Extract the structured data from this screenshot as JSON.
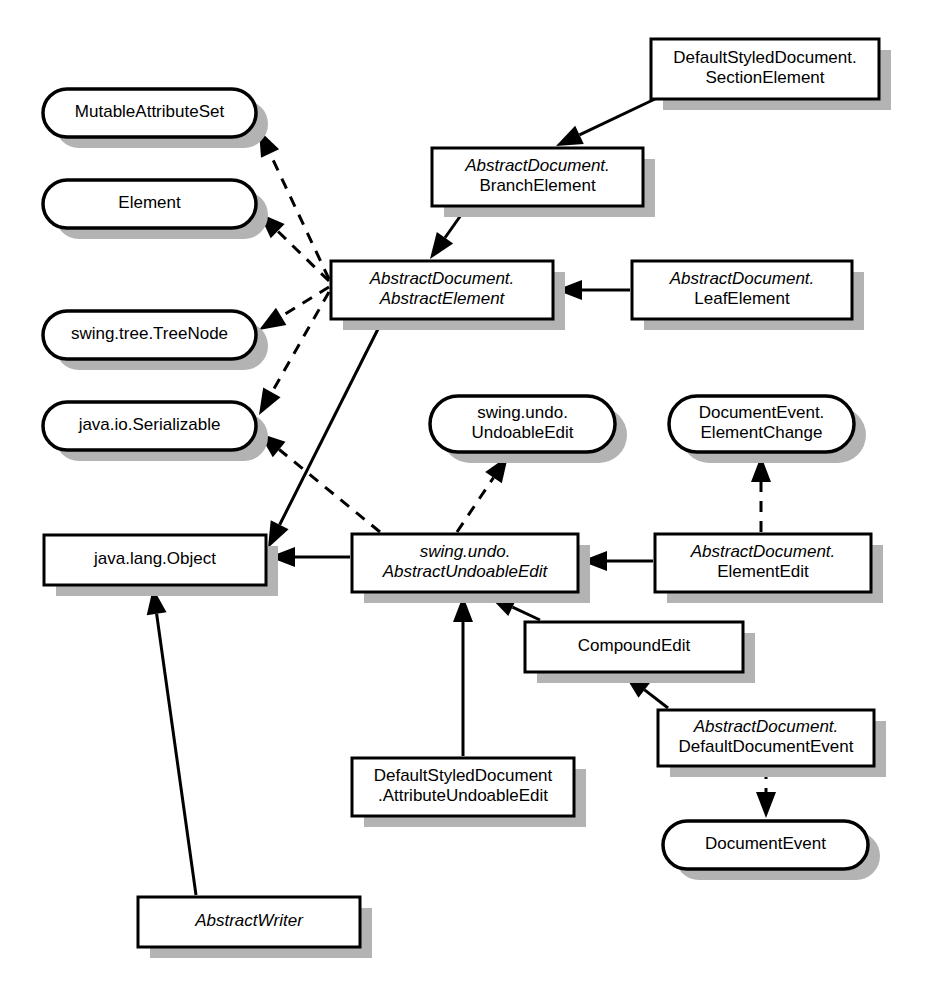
{
  "diagram": {
    "kind": "uml-class-diagram",
    "canvas": {
      "width": 928,
      "height": 1006,
      "background": "#ffffff"
    },
    "style": {
      "box_fill": "#ffffff",
      "box_stroke": "#000000",
      "shadow_color": "#b3b3b3",
      "text_color": "#000000"
    },
    "nodes": [
      {
        "id": "section-element",
        "shape": "class",
        "lines": [
          {
            "text": "DefaultStyledDocument.",
            "italic": false
          },
          {
            "text": "SectionElement",
            "italic": false
          }
        ],
        "x": 651,
        "y": 39,
        "w": 228,
        "h": 60
      },
      {
        "id": "mutable-attribute-set",
        "shape": "interface",
        "lines": [
          {
            "text": "MutableAttributeSet",
            "italic": false
          }
        ],
        "x": 43,
        "y": 89,
        "w": 213,
        "h": 48
      },
      {
        "id": "branch-element",
        "shape": "class",
        "lines": [
          {
            "text": "AbstractDocument.",
            "italic": true
          },
          {
            "text": "BranchElement",
            "italic": false
          }
        ],
        "x": 432,
        "y": 148,
        "w": 211,
        "h": 58
      },
      {
        "id": "element",
        "shape": "interface",
        "lines": [
          {
            "text": "Element",
            "italic": false
          }
        ],
        "x": 43,
        "y": 180,
        "w": 213,
        "h": 48
      },
      {
        "id": "abstract-element",
        "shape": "class",
        "lines": [
          {
            "text": "AbstractDocument.",
            "italic": true
          },
          {
            "text": "AbstractElement",
            "italic": true
          }
        ],
        "x": 331,
        "y": 261,
        "w": 222,
        "h": 58
      },
      {
        "id": "leaf-element",
        "shape": "class",
        "lines": [
          {
            "text": "AbstractDocument.",
            "italic": true
          },
          {
            "text": "LeafElement",
            "italic": false
          }
        ],
        "x": 632,
        "y": 261,
        "w": 220,
        "h": 58
      },
      {
        "id": "tree-node",
        "shape": "interface",
        "lines": [
          {
            "text": "swing.tree.TreeNode",
            "italic": false
          }
        ],
        "x": 43,
        "y": 311,
        "w": 213,
        "h": 48
      },
      {
        "id": "serializable",
        "shape": "interface",
        "lines": [
          {
            "text": "java.io.Serializable",
            "italic": false
          }
        ],
        "x": 43,
        "y": 402,
        "w": 213,
        "h": 48
      },
      {
        "id": "undoable-edit",
        "shape": "interface",
        "lines": [
          {
            "text": "swing.undo.",
            "italic": false
          },
          {
            "text": "UndoableEdit",
            "italic": false
          }
        ],
        "x": 430,
        "y": 396,
        "w": 185,
        "h": 56
      },
      {
        "id": "element-change",
        "shape": "interface",
        "lines": [
          {
            "text": "DocumentEvent.",
            "italic": false
          },
          {
            "text": "ElementChange",
            "italic": false
          }
        ],
        "x": 669,
        "y": 396,
        "w": 185,
        "h": 56
      },
      {
        "id": "java-lang-object",
        "shape": "class",
        "lines": [
          {
            "text": "java.lang.Object",
            "italic": false
          }
        ],
        "x": 44,
        "y": 535,
        "w": 222,
        "h": 50
      },
      {
        "id": "abstract-undoable-edit",
        "shape": "class",
        "lines": [
          {
            "text": "swing.undo.",
            "italic": true
          },
          {
            "text": "AbstractUndoableEdit",
            "italic": true
          }
        ],
        "x": 352,
        "y": 534,
        "w": 226,
        "h": 58
      },
      {
        "id": "element-edit",
        "shape": "class",
        "lines": [
          {
            "text": "AbstractDocument.",
            "italic": true
          },
          {
            "text": "ElementEdit",
            "italic": false
          }
        ],
        "x": 655,
        "y": 534,
        "w": 216,
        "h": 58
      },
      {
        "id": "compound-edit",
        "shape": "class",
        "lines": [
          {
            "text": "CompoundEdit",
            "italic": false
          }
        ],
        "x": 525,
        "y": 622,
        "w": 218,
        "h": 50
      },
      {
        "id": "default-document-event",
        "shape": "class",
        "lines": [
          {
            "text": "AbstractDocument.",
            "italic": true
          },
          {
            "text": "DefaultDocumentEvent",
            "italic": false
          }
        ],
        "x": 658,
        "y": 710,
        "w": 216,
        "h": 56
      },
      {
        "id": "attribute-undoable-edit",
        "shape": "class",
        "lines": [
          {
            "text": "DefaultStyledDocument",
            "italic": false
          },
          {
            "text": ".AttributeUndoableEdit",
            "italic": false
          }
        ],
        "x": 352,
        "y": 758,
        "w": 222,
        "h": 58
      },
      {
        "id": "document-event",
        "shape": "interface",
        "lines": [
          {
            "text": "DocumentEvent",
            "italic": false
          }
        ],
        "x": 663,
        "y": 821,
        "w": 205,
        "h": 48
      },
      {
        "id": "abstract-writer",
        "shape": "class",
        "lines": [
          {
            "text": "AbstractWriter",
            "italic": true
          }
        ],
        "x": 138,
        "y": 897,
        "w": 222,
        "h": 50
      }
    ],
    "edges": [
      {
        "id": "e1",
        "from": "section-element",
        "to": "branch-element",
        "style": "solid",
        "relation": "generalization"
      },
      {
        "id": "e2",
        "from": "branch-element",
        "to": "abstract-element",
        "style": "solid",
        "relation": "generalization"
      },
      {
        "id": "e3",
        "from": "leaf-element",
        "to": "abstract-element",
        "style": "solid",
        "relation": "generalization"
      },
      {
        "id": "e4",
        "from": "abstract-element",
        "to": "mutable-attribute-set",
        "style": "dashed",
        "relation": "realization"
      },
      {
        "id": "e5",
        "from": "abstract-element",
        "to": "element",
        "style": "dashed",
        "relation": "realization"
      },
      {
        "id": "e6",
        "from": "abstract-element",
        "to": "tree-node",
        "style": "dashed",
        "relation": "realization"
      },
      {
        "id": "e7",
        "from": "abstract-element",
        "to": "serializable",
        "style": "dashed",
        "relation": "realization"
      },
      {
        "id": "e8",
        "from": "abstract-element",
        "to": "java-lang-object",
        "style": "solid",
        "relation": "generalization"
      },
      {
        "id": "e9",
        "from": "abstract-undoable-edit",
        "to": "serializable",
        "style": "dashed",
        "relation": "realization"
      },
      {
        "id": "e10",
        "from": "abstract-undoable-edit",
        "to": "undoable-edit",
        "style": "dashed",
        "relation": "realization"
      },
      {
        "id": "e11",
        "from": "abstract-undoable-edit",
        "to": "java-lang-object",
        "style": "solid",
        "relation": "generalization"
      },
      {
        "id": "e12",
        "from": "element-edit",
        "to": "abstract-undoable-edit",
        "style": "solid",
        "relation": "generalization"
      },
      {
        "id": "e13",
        "from": "element-edit",
        "to": "element-change",
        "style": "dashed",
        "relation": "realization"
      },
      {
        "id": "e14",
        "from": "compound-edit",
        "to": "abstract-undoable-edit",
        "style": "solid",
        "relation": "generalization"
      },
      {
        "id": "e15",
        "from": "attribute-undoable-edit",
        "to": "abstract-undoable-edit",
        "style": "solid",
        "relation": "generalization"
      },
      {
        "id": "e16",
        "from": "default-document-event",
        "to": "compound-edit",
        "style": "solid",
        "relation": "generalization"
      },
      {
        "id": "e17",
        "from": "default-document-event",
        "to": "document-event",
        "style": "dashed",
        "relation": "realization"
      },
      {
        "id": "e18",
        "from": "abstract-writer",
        "to": "java-lang-object",
        "style": "solid",
        "relation": "generalization"
      }
    ]
  }
}
